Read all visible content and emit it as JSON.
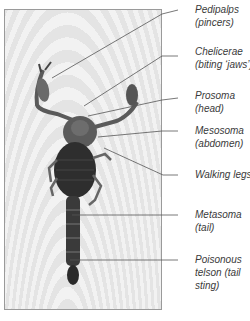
{
  "figure": {
    "labels": [
      {
        "id": "pedipalps",
        "line1": "Pedipalps",
        "line2": "(pincers)",
        "line3": "",
        "top": 3
      },
      {
        "id": "chelicerae",
        "line1": "Chelicerae",
        "line2": "(biting ‘jaws’)",
        "line3": "",
        "top": 45
      },
      {
        "id": "prosoma",
        "line1": "Prosoma",
        "line2": "(head)",
        "line3": "",
        "top": 86
      },
      {
        "id": "mesosoma",
        "line1": "Mesosoma",
        "line2": "(abdomen)",
        "line3": "",
        "top": 125
      },
      {
        "id": "walking-legs",
        "line1": "Walking legs",
        "line2": "",
        "line3": "",
        "top": 168
      },
      {
        "id": "metasoma",
        "line1": "Metasoma",
        "line2": "(tail)",
        "line3": "",
        "top": 206
      },
      {
        "id": "telson",
        "line1": "Poisonous",
        "line2": "telson (tail",
        "line3": "sting)",
        "top": 252
      }
    ],
    "colors": {
      "line": "#555555",
      "text": "#3a3a3a",
      "border": "#9a9a9a"
    }
  }
}
